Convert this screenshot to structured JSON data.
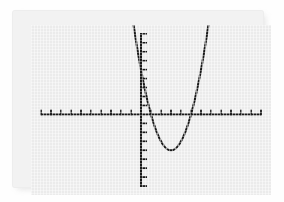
{
  "screen": {
    "device": "graphing-calculator-display",
    "background_color": "#ebebeb",
    "bezel_color": "#f2f2f2",
    "ink_color": "#1a1a1a"
  },
  "chart_data": {
    "type": "line",
    "title": "",
    "subtitle": "",
    "xlabel": "",
    "ylabel": "",
    "legend": [],
    "grid": false,
    "axes": {
      "x_axis_visible": true,
      "y_axis_visible": true,
      "x_tick_spacing": 1,
      "y_tick_spacing": 1,
      "xlim": [
        -11,
        13
      ],
      "ylim": [
        -9,
        10
      ],
      "x_tick_values": [
        -10,
        -9,
        -8,
        -7,
        -6,
        -5,
        -4,
        -3,
        -2,
        -1,
        1,
        2,
        3,
        4,
        5,
        6,
        7,
        8,
        9,
        10,
        11,
        12
      ],
      "y_tick_values": [
        -8,
        -7,
        -6,
        -5,
        -4,
        -3,
        -2,
        -1,
        1,
        2,
        3,
        4,
        5,
        6,
        7,
        8,
        9
      ],
      "tick_labels_shown": false
    },
    "series": [
      {
        "name": "parabola",
        "kind": "quadratic",
        "equation": "y = (x - 3)^2 - 4",
        "vertex": [
          3,
          -4
        ],
        "roots": [
          1,
          5
        ],
        "y_intercept": 5,
        "opens": "up",
        "x": [
          -0.2,
          0.2,
          0.6,
          1.0,
          1.4,
          1.8,
          2.2,
          2.6,
          3.0,
          3.4,
          3.8,
          4.2,
          4.6,
          5.0,
          5.4,
          5.8,
          6.2,
          6.6,
          7.0,
          7.4,
          7.8
        ],
        "y": [
          6.24,
          3.84,
          1.76,
          0.0,
          -1.44,
          -2.56,
          -3.36,
          -3.84,
          -4.0,
          -3.84,
          -3.36,
          -2.56,
          -1.44,
          0.0,
          1.76,
          3.84,
          6.24,
          8.96,
          12.0,
          15.36,
          19.04
        ]
      }
    ],
    "annotations": []
  }
}
